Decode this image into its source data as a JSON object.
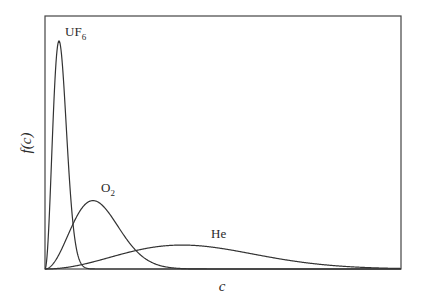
{
  "chart_data": {
    "type": "line",
    "title": "",
    "xlabel": "c",
    "ylabel": "f(c)",
    "grid": false,
    "legend": "none (curves labeled directly)",
    "axis_ticks": "none",
    "x_range_px": [
      0,
      356
    ],
    "series": [
      {
        "name": "UF6",
        "label_main": "UF",
        "label_sub": "6",
        "most_probable_speed_rel": 14,
        "peak_height_rel": 1.0
      },
      {
        "name": "O2",
        "label_main": "O",
        "label_sub": "2",
        "most_probable_speed_rel": 48,
        "peak_height_rel": 0.3
      },
      {
        "name": "He",
        "label_main": "He",
        "label_sub": "",
        "most_probable_speed_rel": 137,
        "peak_height_rel": 0.105
      }
    ]
  },
  "colors": {
    "line": "#333333",
    "frame": "#444444",
    "text": "#2a2a2a"
  }
}
